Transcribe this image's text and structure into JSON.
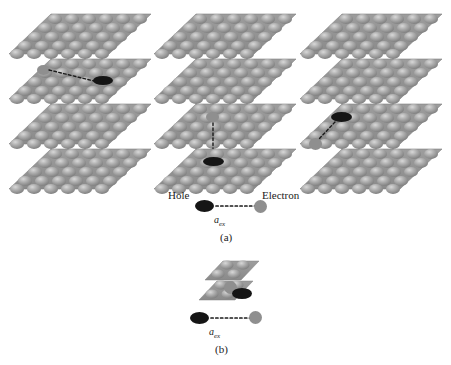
{
  "figure": {
    "title_visible": false,
    "background": "#ffffff",
    "colors": {
      "atom_body": "#9a9a9a",
      "atom_shade": "#858585",
      "atom_highlight": "#c9c9c9",
      "sheet_edge": "#8d8d8d",
      "hole": "#151515",
      "electron": "#8f8f8f",
      "dash_line": "#1a1a1a",
      "text": "#1a1a1a"
    },
    "panels": [
      {
        "id": "a",
        "label": "(a)",
        "description": "Three stacks of four layered 2D crystal sheets, each showing a different exciton orientation",
        "columns": [
          {
            "id": "column-left",
            "exciton_type": "in-plane",
            "layers": 4,
            "exciton_layer": 2,
            "electron_position": "left-in-layer-2",
            "hole_position": "right-in-layer-2"
          },
          {
            "id": "column-middle",
            "exciton_type": "vertical-interlayer",
            "layers": 4,
            "electron_layer": 3,
            "hole_layer": 4
          },
          {
            "id": "column-right",
            "exciton_type": "diagonal-interlayer",
            "layers": 4,
            "hole_layer": 3,
            "electron_layer": 4
          }
        ],
        "legend": {
          "hole_label": "Hole",
          "electron_label": "Electron",
          "distance_symbol": "a",
          "distance_subscript": "ex"
        }
      },
      {
        "id": "b",
        "label": "(b)",
        "description": "Small two-layer nanocrystal with tightly bound exciton; hole and electron nearly overlapping",
        "layers": 2,
        "legend": {
          "distance_symbol": "a",
          "distance_subscript": "ex"
        }
      }
    ]
  }
}
